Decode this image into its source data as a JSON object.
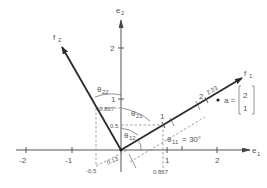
{
  "figure": {
    "axes": {
      "e1_label": "e",
      "e1_sub": "1",
      "e2_label": "e",
      "e2_sub": "2",
      "e1_ticks": [
        "-2",
        "-1",
        "1",
        "2"
      ],
      "e2_ticks": [
        "2",
        "1"
      ]
    },
    "vectors": {
      "f1_label": "f",
      "f1_sub": "1",
      "f2_label": "f",
      "f2_sub": "2",
      "f1_tick_labels": [
        "1",
        "2",
        "2.23"
      ]
    },
    "point": {
      "label": "a =",
      "matrix_top": "2",
      "matrix_bottom": "1"
    },
    "annotations": {
      "e2_0867": "0.867",
      "e2_05": "0.5",
      "e1_neg05": "-0.5",
      "e1_0867": "0.867",
      "proj_013": "0.13",
      "theta": "θ",
      "theta11_sub": "11",
      "theta11_value": "= 30°",
      "theta12_sub": "12",
      "theta21_sub": "21",
      "theta22_sub": "22"
    }
  }
}
